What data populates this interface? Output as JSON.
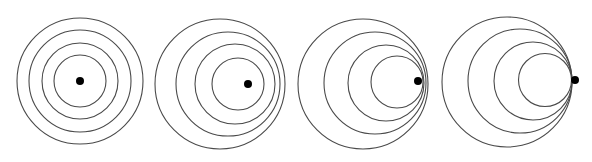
{
  "figure": {
    "background": "#ffffff",
    "ring_color": "#4a4a4a",
    "dot_color": "#000000",
    "panels": [
      {
        "label": "stationary-source",
        "rings": [
          {
            "cx": 80,
            "cy": 81,
            "r": 63
          },
          {
            "cx": 80,
            "cy": 81,
            "r": 51
          },
          {
            "cx": 80,
            "cy": 81,
            "r": 38
          },
          {
            "cx": 80,
            "cy": 81,
            "r": 26
          }
        ],
        "source": {
          "cx": 80,
          "cy": 81,
          "r": 4
        }
      },
      {
        "label": "subsonic-source",
        "rings": [
          {
            "cx": 220,
            "cy": 84,
            "r": 65
          },
          {
            "cx": 228,
            "cy": 84,
            "r": 52
          },
          {
            "cx": 235,
            "cy": 84,
            "r": 40
          },
          {
            "cx": 238,
            "cy": 84,
            "r": 26
          }
        ],
        "source": {
          "cx": 248,
          "cy": 84,
          "r": 4
        }
      },
      {
        "label": "near-sonic-source",
        "rings": [
          {
            "cx": 363,
            "cy": 84,
            "r": 65
          },
          {
            "cx": 375,
            "cy": 83,
            "r": 51
          },
          {
            "cx": 386,
            "cy": 83,
            "r": 38
          },
          {
            "cx": 397,
            "cy": 82,
            "r": 26
          }
        ],
        "source": {
          "cx": 418,
          "cy": 81,
          "r": 4
        }
      },
      {
        "label": "sonic-source",
        "rings": [
          {
            "cx": 507,
            "cy": 82,
            "r": 65
          },
          {
            "cx": 520,
            "cy": 81,
            "r": 52
          },
          {
            "cx": 533,
            "cy": 81,
            "r": 39
          },
          {
            "cx": 545,
            "cy": 80,
            "r": 26.5
          }
        ],
        "source": {
          "cx": 575,
          "cy": 80,
          "r": 4
        }
      }
    ]
  }
}
